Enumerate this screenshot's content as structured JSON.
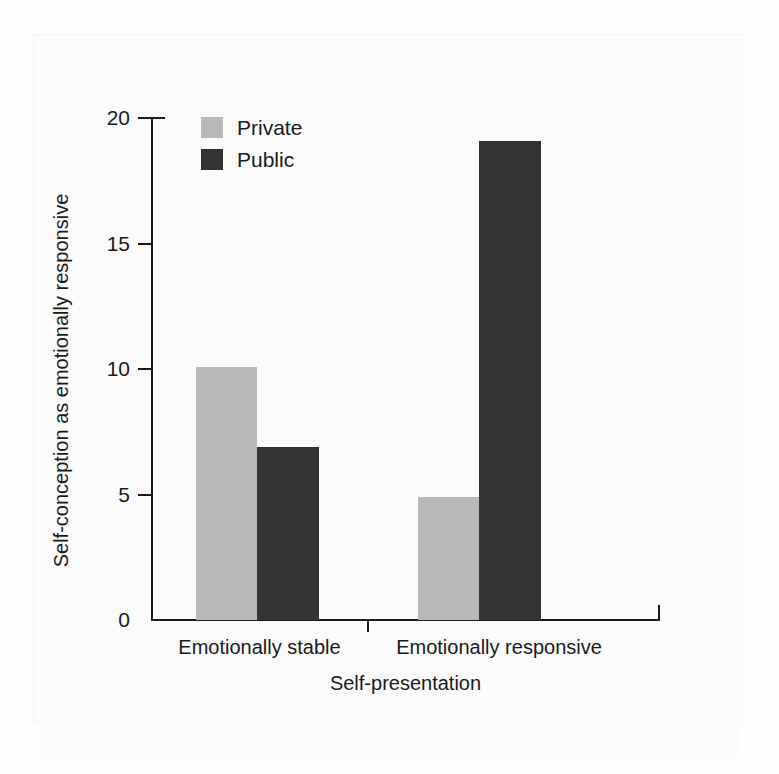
{
  "chart_data": {
    "type": "bar",
    "title": "",
    "subtitle": "",
    "xlabel": "Self-presentation",
    "ylabel": "Self-conception as emotionally responsive",
    "categories": [
      "Emotionally stable",
      "Emotionally responsive"
    ],
    "series": [
      {
        "name": "Private",
        "values": [
          10.1,
          4.9
        ],
        "color": "#b9b9b9"
      },
      {
        "name": "Public",
        "values": [
          6.9,
          19.1
        ],
        "color": "#333333"
      }
    ],
    "ylim": [
      0,
      20
    ],
    "yticks": [
      0,
      5,
      10,
      15,
      20
    ],
    "ytick_labels": [
      "0",
      "5",
      "10",
      "15",
      "20"
    ],
    "grid": false,
    "legend_position": "top-left",
    "annotations": []
  },
  "legend": {
    "entries": [
      {
        "label": "Private",
        "color": "#b9b9b9"
      },
      {
        "label": "Public",
        "color": "#333333"
      }
    ]
  },
  "axes": {
    "y_title": "Self-conception as emotionally responsive",
    "x_title": "Self-presentation",
    "y_tick_labels": [
      "20",
      "15",
      "10",
      "5",
      "0"
    ],
    "x_group_labels": [
      "Emotionally stable",
      "Emotionally responsive"
    ]
  },
  "colors": {
    "private_bar": "#b9b9b9",
    "public_bar": "#333333",
    "axis": "#1a1a1a",
    "page_background": "#fbfbfb",
    "text": "#1a1a1a"
  }
}
